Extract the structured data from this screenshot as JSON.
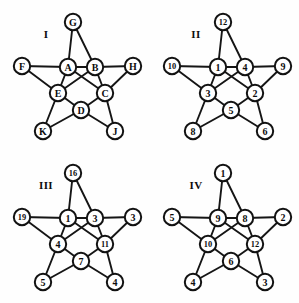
{
  "page": {
    "background_color": "#fefefe",
    "ink_color": "#121212"
  },
  "geometry": {
    "node_radius": 8.2,
    "two_digit_threshold": 2,
    "positions": {
      "outer_top": {
        "x": 73,
        "y": 22
      },
      "outer_left": {
        "x": 22,
        "y": 66
      },
      "outer_right": {
        "x": 133,
        "y": 66
      },
      "outer_bottomleft": {
        "x": 43,
        "y": 131
      },
      "outer_bottomright": {
        "x": 115,
        "y": 131
      },
      "inner_topleft": {
        "x": 68,
        "y": 67
      },
      "inner_topright": {
        "x": 95,
        "y": 67
      },
      "inner_left": {
        "x": 58,
        "y": 93
      },
      "inner_right": {
        "x": 105,
        "y": 93
      },
      "inner_bottom": {
        "x": 81,
        "y": 110
      }
    },
    "edges": [
      [
        "outer_top",
        "inner_topleft"
      ],
      [
        "outer_top",
        "inner_topright"
      ],
      [
        "outer_left",
        "inner_topleft"
      ],
      [
        "outer_left",
        "inner_left"
      ],
      [
        "outer_right",
        "inner_topright"
      ],
      [
        "outer_right",
        "inner_right"
      ],
      [
        "outer_bottomleft",
        "inner_left"
      ],
      [
        "outer_bottomleft",
        "inner_bottom"
      ],
      [
        "outer_bottomright",
        "inner_right"
      ],
      [
        "outer_bottomright",
        "inner_bottom"
      ],
      [
        "inner_topleft",
        "inner_topright"
      ],
      [
        "inner_topleft",
        "inner_left"
      ],
      [
        "inner_topright",
        "inner_right"
      ],
      [
        "inner_left",
        "inner_bottom"
      ],
      [
        "inner_right",
        "inner_bottom"
      ],
      [
        "inner_topleft",
        "inner_right"
      ],
      [
        "inner_topright",
        "inner_left"
      ]
    ],
    "caption_position": {
      "x": 46,
      "y": 38
    }
  },
  "figures": [
    {
      "id": "I",
      "caption": "I",
      "nodes": {
        "outer_top": "G",
        "outer_left": "F",
        "outer_right": "H",
        "outer_bottomleft": "K",
        "outer_bottomright": "J",
        "inner_topleft": "A",
        "inner_topright": "B",
        "inner_left": "E",
        "inner_right": "C",
        "inner_bottom": "D"
      }
    },
    {
      "id": "II",
      "caption": "II",
      "nodes": {
        "outer_top": "12",
        "outer_left": "10",
        "outer_right": "9",
        "outer_bottomleft": "8",
        "outer_bottomright": "6",
        "inner_topleft": "1",
        "inner_topright": "4",
        "inner_left": "3",
        "inner_right": "2",
        "inner_bottom": "5"
      }
    },
    {
      "id": "III",
      "caption": "III",
      "nodes": {
        "outer_top": "16",
        "outer_left": "19",
        "outer_right": "3",
        "outer_bottomleft": "5",
        "outer_bottomright": "4",
        "inner_topleft": "1",
        "inner_topright": "3",
        "inner_left": "4",
        "inner_right": "11",
        "inner_bottom": "7"
      }
    },
    {
      "id": "IV",
      "caption": "IV",
      "nodes": {
        "outer_top": "1",
        "outer_left": "5",
        "outer_right": "2",
        "outer_bottomleft": "4",
        "outer_bottomright": "3",
        "inner_topleft": "9",
        "inner_topright": "8",
        "inner_left": "10",
        "inner_right": "12",
        "inner_bottom": "6"
      }
    }
  ]
}
